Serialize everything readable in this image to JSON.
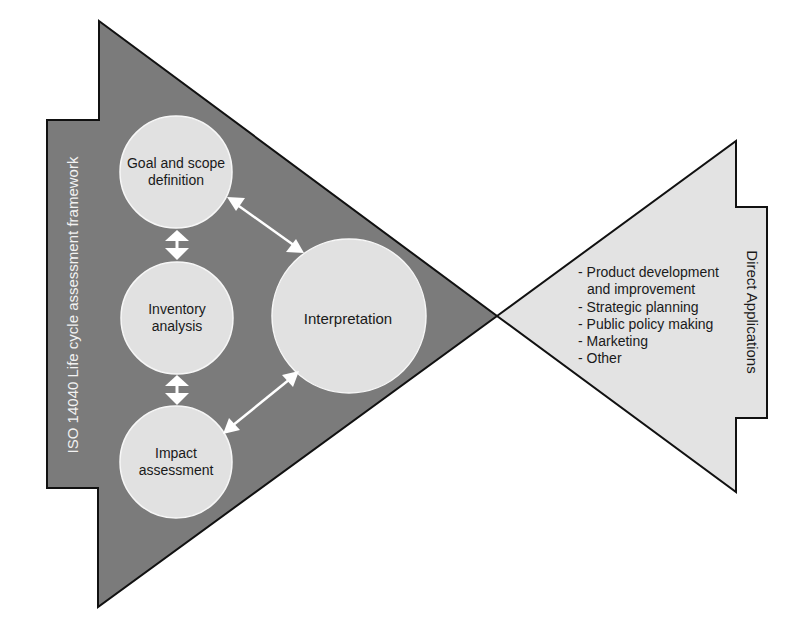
{
  "framework": {
    "label": "ISO 14040 Life cycle assessment framework",
    "fill_color": "#7b7b7b",
    "stages": [
      {
        "id": "goal",
        "label_lines": [
          "Goal and scope",
          "definition"
        ]
      },
      {
        "id": "inventory",
        "label_lines": [
          "Inventory",
          "analysis"
        ]
      },
      {
        "id": "impact",
        "label_lines": [
          "Impact",
          "assessment"
        ]
      },
      {
        "id": "interpretation",
        "label_lines": [
          "Interpretation"
        ]
      }
    ],
    "stage_fill_color": "#e1e1e1"
  },
  "applications": {
    "label": "Direct Applications",
    "fill_color": "#e3e3e3",
    "items": [
      {
        "text": "- Product development",
        "continuation": "and improvement"
      },
      {
        "text": "- Strategic planning"
      },
      {
        "text": "- Public policy making"
      },
      {
        "text": "- Marketing"
      },
      {
        "text": "- Other"
      }
    ]
  },
  "connections": [
    {
      "from": "goal",
      "to": "inventory",
      "type": "bidirectional"
    },
    {
      "from": "inventory",
      "to": "impact",
      "type": "bidirectional"
    },
    {
      "from": "goal",
      "to": "interpretation",
      "type": "bidirectional"
    },
    {
      "from": "impact",
      "to": "interpretation",
      "type": "bidirectional"
    }
  ]
}
